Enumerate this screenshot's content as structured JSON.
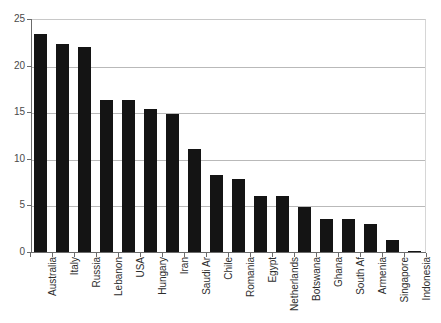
{
  "chart_data": {
    "type": "bar",
    "title": "",
    "subtitle": "",
    "xlabel": "",
    "ylabel": "",
    "ylim": [
      0,
      25
    ],
    "yticks": [
      0,
      5,
      10,
      15,
      20,
      25
    ],
    "grid": true,
    "legend": null,
    "bar_color": "#141414",
    "categories": [
      "Australia",
      "Italy",
      "Russia",
      "Lebanon",
      "USA",
      "Hungary",
      "Iran",
      "Saudi Ar",
      "Chile",
      "Romania",
      "Egypt",
      "Netherlands",
      "Botswana",
      "Ghana",
      "South Af",
      "Armenia",
      "Singapore",
      "Indonesia"
    ],
    "values": [
      23.4,
      22.3,
      22.0,
      16.3,
      16.3,
      15.3,
      14.8,
      11.0,
      8.3,
      7.8,
      6.0,
      6.0,
      4.8,
      3.5,
      3.5,
      3.0,
      1.3,
      0.1
    ]
  }
}
